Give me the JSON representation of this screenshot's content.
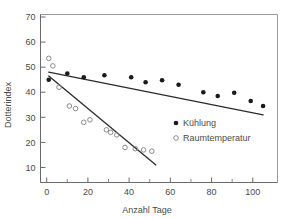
{
  "chart_data": {
    "type": "scatter",
    "title": "",
    "xlabel": "Anzahl Tage",
    "ylabel": "Dotterindex",
    "xlim": [
      -3,
      112
    ],
    "ylim": [
      4,
      71
    ],
    "xticks": [
      0,
      20,
      40,
      60,
      80,
      100
    ],
    "xticklabels": [
      "0",
      "20",
      "40",
      "60",
      "80",
      "100"
    ],
    "xminorticks": [
      10,
      30,
      50,
      70,
      90
    ],
    "yticks": [
      10,
      20,
      30,
      40,
      50,
      60,
      70
    ],
    "yticklabels": [
      "10",
      "20",
      "30",
      "40",
      "50",
      "60",
      "70"
    ],
    "grid": false,
    "legend_position": "lower right",
    "series": [
      {
        "name": "Kühlung",
        "marker": "filled-circle",
        "color": "#1a1a1a",
        "points": [
          {
            "x": 1,
            "y": 45.0
          },
          {
            "x": 10,
            "y": 47.5
          },
          {
            "x": 18,
            "y": 46.0
          },
          {
            "x": 28,
            "y": 46.8
          },
          {
            "x": 41,
            "y": 46.0
          },
          {
            "x": 48,
            "y": 44.0
          },
          {
            "x": 56,
            "y": 44.8
          },
          {
            "x": 64,
            "y": 43.0
          },
          {
            "x": 76,
            "y": 40.0
          },
          {
            "x": 83,
            "y": 38.5
          },
          {
            "x": 91,
            "y": 39.8
          },
          {
            "x": 99,
            "y": 36.5
          },
          {
            "x": 105,
            "y": 34.5
          }
        ],
        "fit_line": {
          "x1": 1,
          "y1": 48.0,
          "x2": 105,
          "y2": 31.0
        }
      },
      {
        "name": "Raumtemperatur",
        "marker": "open-circle",
        "color": "#8a8a8a",
        "points": [
          {
            "x": 1,
            "y": 53.5
          },
          {
            "x": 3,
            "y": 50.5
          },
          {
            "x": 6,
            "y": 42.0
          },
          {
            "x": 11,
            "y": 34.5
          },
          {
            "x": 14,
            "y": 33.5
          },
          {
            "x": 18,
            "y": 28.0
          },
          {
            "x": 21,
            "y": 29.0
          },
          {
            "x": 29,
            "y": 25.0
          },
          {
            "x": 31,
            "y": 24.0
          },
          {
            "x": 34,
            "y": 23.0
          },
          {
            "x": 38,
            "y": 18.0
          },
          {
            "x": 43,
            "y": 17.5
          },
          {
            "x": 47,
            "y": 17.0
          },
          {
            "x": 51,
            "y": 16.5
          }
        ],
        "fit_line": {
          "x1": 1,
          "y1": 46.5,
          "x2": 53,
          "y2": 11.0
        }
      }
    ]
  },
  "legend": {
    "entries": [
      {
        "label": "Kühlung",
        "marker": "filled-circle"
      },
      {
        "label": "Raumtemperatur",
        "marker": "open-circle"
      }
    ]
  }
}
